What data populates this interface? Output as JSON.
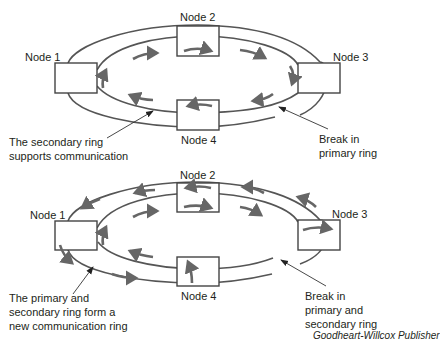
{
  "diagrams": [
    {
      "id": "top",
      "title": "Break in primary ring",
      "nodes": [
        {
          "label": "Node 1"
        },
        {
          "label": "Node 2"
        },
        {
          "label": "Node 3"
        },
        {
          "label": "Node 4"
        }
      ],
      "callouts": {
        "left": [
          "The secondary ring",
          "supports communication"
        ],
        "right": [
          "Break in",
          "primary ring"
        ]
      }
    },
    {
      "id": "bottom",
      "title": "Break in primary and secondary ring",
      "nodes": [
        {
          "label": "Node 1"
        },
        {
          "label": "Node 2"
        },
        {
          "label": "Node 3"
        },
        {
          "label": "Node 4"
        }
      ],
      "callouts": {
        "left": [
          "The primary and",
          "secondary ring form a",
          "new communication ring"
        ],
        "right": [
          "Break in",
          "primary and",
          "secondary ring"
        ]
      }
    }
  ],
  "credit": "Goodheart-Willcox Publisher",
  "colors": {
    "ring": "#555555",
    "arrow": "#666666",
    "text": "#231f20"
  }
}
